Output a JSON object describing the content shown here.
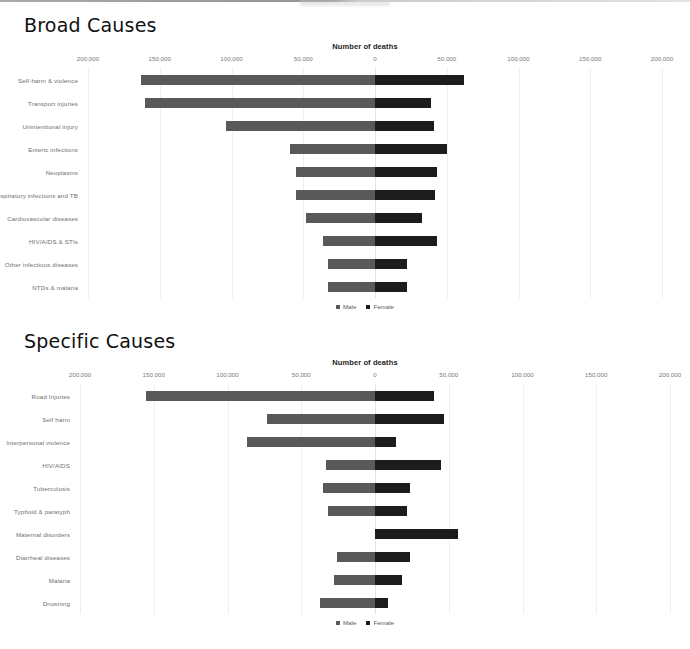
{
  "page": {
    "rule_icon": "horizontal-rule"
  },
  "sections": [
    {
      "id": "broad",
      "title": "Broad Causes",
      "axis_title": "Number of deaths",
      "legend": {
        "male": "Male",
        "female": "Female"
      }
    },
    {
      "id": "specific",
      "title": "Specific Causes",
      "axis_title": "Number of deaths",
      "legend": {
        "male": "Male",
        "female": "Female"
      }
    }
  ],
  "colors": {
    "male": "#595959",
    "female": "#1c1c1c",
    "grid": "#efefef",
    "text": "#6f6f6f"
  },
  "chart_data": [
    {
      "type": "bar",
      "orientation": "horizontal",
      "layout": "diverging-population-pyramid",
      "title": "Broad Causes",
      "xlabel": "Number of deaths",
      "ylabel": "",
      "grid": true,
      "legend_position": "bottom",
      "xlim": [
        -200000,
        200000
      ],
      "xticks": [
        -200000,
        -150000,
        -100000,
        -50000,
        0,
        50000,
        100000,
        150000,
        200000
      ],
      "xticklabels": [
        "200,000",
        "150,000",
        "100,000",
        "50,000",
        "0",
        "50,000",
        "100,000",
        "150,000",
        "200,000"
      ],
      "categories": [
        "Self-harm & violence",
        "Transport injuries",
        "Unintentional injury",
        "Enteric infections",
        "Neoplasms",
        "Respiratory infections and TB",
        "Cardiovascular diseases",
        "HIV/AIDS & STIs",
        "Other infectious diseases",
        "NTDs & malaria"
      ],
      "series": [
        {
          "name": "Male",
          "values": [
            163000,
            160000,
            104000,
            59000,
            55000,
            55000,
            48000,
            36000,
            33000,
            33000
          ]
        },
        {
          "name": "Female",
          "values": [
            62000,
            39000,
            41000,
            50000,
            43000,
            42000,
            33000,
            43000,
            22000,
            22000
          ]
        }
      ]
    },
    {
      "type": "bar",
      "orientation": "horizontal",
      "layout": "diverging-population-pyramid",
      "title": "Specific Causes",
      "xlabel": "Number of deaths",
      "ylabel": "",
      "grid": true,
      "legend_position": "bottom",
      "xlim": [
        -200000,
        200000
      ],
      "xticks": [
        -200000,
        -150000,
        -100000,
        -50000,
        0,
        50000,
        100000,
        150000,
        200000
      ],
      "xticklabels": [
        "200,000",
        "150,000",
        "100,000",
        "50,000",
        "0",
        "50,000",
        "100,000",
        "150,000",
        "200,000"
      ],
      "categories": [
        "Road Injuries",
        "Self harm",
        "Interpersonal violence",
        "HIV/AIDS",
        "Tuberculosis",
        "Typhoid & paratyph",
        "Maternal disorders",
        "Diarrheal diseases",
        "Malaria",
        "Drowning"
      ],
      "series": [
        {
          "name": "Male",
          "values": [
            155000,
            73000,
            87000,
            33000,
            35000,
            32000,
            0,
            26000,
            28000,
            37000
          ]
        },
        {
          "name": "Female",
          "values": [
            40000,
            47000,
            14000,
            45000,
            24000,
            22000,
            56000,
            24000,
            18000,
            9000
          ]
        }
      ]
    }
  ]
}
